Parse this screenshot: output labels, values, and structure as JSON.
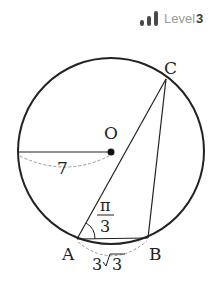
{
  "header": {
    "level_label": "Level",
    "level_value": "3",
    "level_bars": 3
  },
  "diagram": {
    "points": {
      "O": {
        "label": "O"
      },
      "A": {
        "label": "A"
      },
      "B": {
        "label": "B"
      },
      "C": {
        "label": "C"
      }
    },
    "radius_label": "7",
    "angle_label_num": "π",
    "angle_label_den": "3",
    "chord_ab_coef": "3",
    "chord_ab_radicand": "3",
    "colors": {
      "stroke": "#222222",
      "dashed": "#999999",
      "level_bar": "#4a4a4a",
      "level_text": "#9a9a9a"
    }
  }
}
